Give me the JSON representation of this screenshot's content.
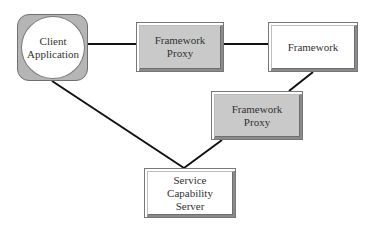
{
  "diagram": {
    "type": "architecture",
    "nodes": {
      "client": {
        "label": "Client\nApplication",
        "shape": "circle-in-rounded-square",
        "fill": "#b5b5b5"
      },
      "proxy1": {
        "label": "Framework\nProxy",
        "shape": "beveled-rectangle",
        "fill": "#c9c9c9"
      },
      "framework": {
        "label": "Framework",
        "shape": "beveled-rectangle",
        "fill": "#ffffff"
      },
      "proxy2": {
        "label": "Framework\nProxy",
        "shape": "beveled-rectangle",
        "fill": "#c9c9c9"
      },
      "server": {
        "label": "Service\nCapability\nServer",
        "shape": "beveled-rectangle",
        "fill": "#ffffff"
      }
    },
    "edges": [
      {
        "from": "client",
        "to": "proxy1"
      },
      {
        "from": "proxy1",
        "to": "framework"
      },
      {
        "from": "framework",
        "to": "proxy2"
      },
      {
        "from": "client",
        "to": "server"
      },
      {
        "from": "proxy2",
        "to": "server"
      }
    ],
    "colors": {
      "line": "#111111",
      "border": "#777777",
      "shaded_fill": "#c9c9c9",
      "client_frame": "#b5b5b5",
      "text": "#333333"
    }
  }
}
